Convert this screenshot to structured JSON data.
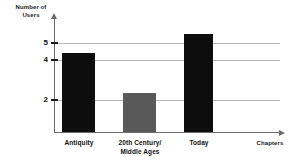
{
  "chart_data": {
    "type": "bar",
    "title": "",
    "xlabel": "Chapters",
    "ylabel": "Number of Users",
    "categories": [
      "Antiquity",
      "20th Century/\nMiddle Ages",
      "Today"
    ],
    "values": [
      4,
      2,
      5
    ],
    "ylim": [
      0,
      5.8
    ],
    "yticks": [
      2,
      4,
      5
    ],
    "ytick_labels": [
      "2",
      "4",
      "5"
    ],
    "grid": "horizontal gridlines at each y tick, extending right from axis",
    "legend": "none",
    "bar_colors": [
      "#0d0d0d",
      "#595959",
      "#0d0d0d"
    ]
  },
  "axes": {
    "y_title": "Number of\nUsers",
    "y_title_line1": "Number of",
    "y_title_line2": "Users",
    "x_title": "Chapters"
  },
  "ticks": {
    "t5": "5",
    "t4": "4",
    "t2": "2"
  },
  "categories": {
    "c1": "Antiquity",
    "c2_line1": "20th Century/",
    "c2_line2": "Middle Ages",
    "c3": "Today"
  },
  "colors": {
    "bar_dark": "#0d0d0d",
    "bar_gray": "#595959",
    "axis": "#6b6b6b",
    "gridline": "#b6b6b6",
    "text": "#111111",
    "background": "#ffffff"
  }
}
